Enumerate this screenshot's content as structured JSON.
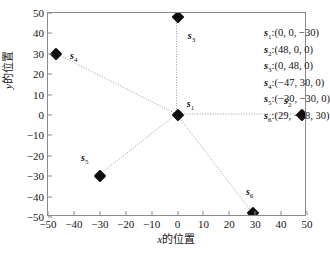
{
  "chart_data": {
    "type": "scatter",
    "title": "",
    "xlabel": "x的位置",
    "ylabel": "y的位置",
    "xlim": [
      -50,
      50
    ],
    "ylim": [
      -50,
      50
    ],
    "xticks": [
      "-50",
      "-40",
      "-30",
      "-20",
      "-10",
      "0",
      "10",
      "20",
      "30",
      "40",
      "50"
    ],
    "yticks": [
      "50",
      "40",
      "30",
      "20",
      "10",
      "0",
      "-10",
      "-20",
      "-30",
      "-40",
      "-50"
    ],
    "grid": false,
    "legend_position": "top-right-inside",
    "marker": "diamond",
    "marker_color": "#0d0d0d",
    "line_style": "dotted",
    "line_color": "#9a9a9a",
    "points": [
      {
        "id": "s1",
        "label": "s",
        "sub": "1",
        "x": 0,
        "y": 0,
        "z": -30,
        "label_dx": 13,
        "label_dy": -9
      },
      {
        "id": "s2",
        "label": "s",
        "sub": "2",
        "x": 48,
        "y": 0,
        "z": 0,
        "label_dx": -14,
        "label_dy": -12
      },
      {
        "id": "s3",
        "label": "s",
        "sub": "3",
        "x": 0,
        "y": 48,
        "z": 0,
        "label_dx": 14,
        "label_dy": 21
      },
      {
        "id": "s4",
        "label": "s",
        "sub": "4",
        "x": -47,
        "y": 30,
        "z": 0,
        "label_dx": 18,
        "label_dy": 4
      },
      {
        "id": "s5",
        "label": "s",
        "sub": "5",
        "x": -30,
        "y": -30,
        "z": 0,
        "label_dx": -15,
        "label_dy": -16
      },
      {
        "id": "s6",
        "label": "s",
        "sub": "6",
        "x": 29,
        "y": -48,
        "z": 30,
        "label_dx": -3,
        "label_dy": -19
      }
    ],
    "edges": [
      {
        "from": "s1",
        "to": "s2"
      },
      {
        "from": "s1",
        "to": "s3"
      },
      {
        "from": "s1",
        "to": "s4"
      },
      {
        "from": "s1",
        "to": "s5"
      },
      {
        "from": "s1",
        "to": "s6"
      }
    ],
    "legend_entries": [
      {
        "symbol": "s",
        "sub": "1",
        "coords": "(0, 0, −30)",
        "text": "s₁:(0, 0, −30)"
      },
      {
        "symbol": "s",
        "sub": "2",
        "coords": "(48, 0, 0)",
        "text": "s₂:(48, 0, 0)"
      },
      {
        "symbol": "s",
        "sub": "3",
        "coords": "(0, 48, 0)",
        "text": "s₃:(0, 48, 0)"
      },
      {
        "symbol": "s",
        "sub": "4",
        "coords": "(−47, 30, 0)",
        "text": "s₄:(−47, 30, 0)"
      },
      {
        "symbol": "s",
        "sub": "5",
        "coords": "(−30, −30, 0)",
        "text": "s₅:(−30, −30, 0)"
      },
      {
        "symbol": "s",
        "sub": "6",
        "coords": "(29, −48, 30)",
        "text": "s₆:(29, −48, 30)"
      }
    ]
  }
}
